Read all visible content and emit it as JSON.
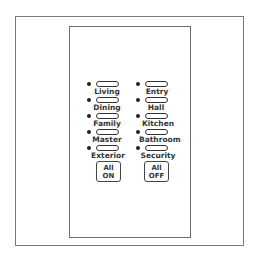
{
  "keypad": {
    "left_column": [
      {
        "label": "Living"
      },
      {
        "label": "Dining"
      },
      {
        "label": "Family"
      },
      {
        "label": "Master"
      },
      {
        "label": "Exterior"
      }
    ],
    "right_column": [
      {
        "label": "Entry"
      },
      {
        "label": "Hall"
      },
      {
        "label": "Kitchen"
      },
      {
        "label": "Bathroom"
      },
      {
        "label": "Security"
      }
    ],
    "all_on": {
      "line1": "All",
      "line2": "ON"
    },
    "all_off": {
      "line1": "All",
      "line2": "OFF"
    }
  }
}
